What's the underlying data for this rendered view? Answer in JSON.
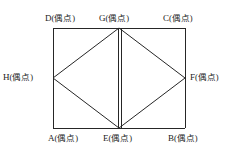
{
  "figure": {
    "type": "geometry-diagram",
    "stroke_color": "#262626",
    "background_color": "#ffffff",
    "stroke_width": 1,
    "rectangle": {
      "left": 53,
      "top": 28,
      "right": 185,
      "bottom": 128
    },
    "vertices": [
      {
        "id": "D",
        "name": "D",
        "note": "(偶点)",
        "x": 53,
        "y": 28,
        "role": "rectangle-corner-top-left"
      },
      {
        "id": "G",
        "name": "G",
        "note": "(偶点)",
        "x": 119,
        "y": 28,
        "role": "top-edge-midpoint"
      },
      {
        "id": "C",
        "name": "C",
        "note": "(偶点)",
        "x": 185,
        "y": 28,
        "role": "rectangle-corner-top-right"
      },
      {
        "id": "H",
        "name": "H",
        "note": "(偶点)",
        "x": 53,
        "y": 78,
        "role": "left-edge-midpoint"
      },
      {
        "id": "F",
        "name": "F",
        "note": "(偶点)",
        "x": 185,
        "y": 78,
        "role": "right-edge-midpoint"
      },
      {
        "id": "A",
        "name": "A",
        "note": "(偶点)",
        "x": 53,
        "y": 128,
        "role": "rectangle-corner-bottom-left"
      },
      {
        "id": "E",
        "name": "E",
        "note": "(偶点)",
        "x": 119,
        "y": 128,
        "role": "bottom-edge-midpoint"
      },
      {
        "id": "B",
        "name": "B",
        "note": "(偶点)",
        "x": 185,
        "y": 128,
        "role": "rectangle-corner-bottom-right"
      }
    ],
    "edges": [
      {
        "from": "D",
        "to": "C",
        "style": "single"
      },
      {
        "from": "C",
        "to": "B",
        "style": "single"
      },
      {
        "from": "B",
        "to": "A",
        "style": "single"
      },
      {
        "from": "A",
        "to": "D",
        "style": "single"
      },
      {
        "from": "H",
        "to": "G",
        "style": "single"
      },
      {
        "from": "G",
        "to": "F",
        "style": "single"
      },
      {
        "from": "F",
        "to": "E",
        "style": "single"
      },
      {
        "from": "E",
        "to": "H",
        "style": "single"
      },
      {
        "from": "G",
        "to": "E",
        "style": "double"
      }
    ]
  }
}
